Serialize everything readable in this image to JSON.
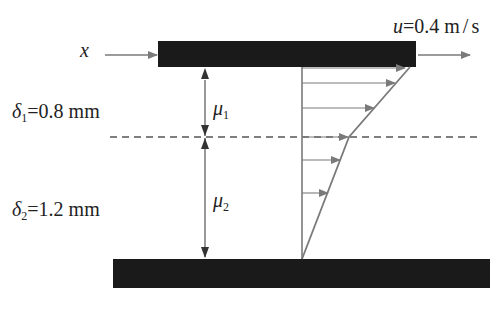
{
  "diagram": {
    "axis_label": "x",
    "velocity": {
      "symbol": "u",
      "value": "0.4",
      "unit": "m / s",
      "text": "u=0.4 m/s"
    },
    "layer1": {
      "thickness_symbol": "δ",
      "thickness_sub": "1",
      "thickness_value": "=0.8 mm",
      "viscosity_symbol": "μ",
      "viscosity_sub": "1"
    },
    "layer2": {
      "thickness_symbol": "δ",
      "thickness_sub": "2",
      "thickness_value": "=1.2 mm",
      "viscosity_symbol": "μ",
      "viscosity_sub": "2"
    },
    "colors": {
      "plate": "#1a1a1a",
      "line": "#7a7a7a",
      "text": "#222222"
    }
  }
}
